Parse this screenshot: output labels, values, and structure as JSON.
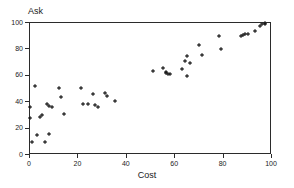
{
  "chart_data": {
    "type": "scatter",
    "title": "",
    "xlabel": "Cost",
    "ylabel": "Ask",
    "xlim": [
      0,
      100
    ],
    "ylim": [
      0,
      100
    ],
    "xticks": [
      0,
      20,
      40,
      60,
      80,
      100
    ],
    "yticks": [
      0,
      20,
      40,
      60,
      80,
      100
    ],
    "grid": false,
    "legend": null,
    "marker": "asterisk",
    "marker_color": "#111111",
    "series": [
      {
        "name": "observations",
        "points": [
          [
            0,
            36
          ],
          [
            0,
            28
          ],
          [
            1,
            10
          ],
          [
            2,
            52
          ],
          [
            3,
            15
          ],
          [
            4,
            29
          ],
          [
            5,
            30
          ],
          [
            6,
            10
          ],
          [
            7,
            39
          ],
          [
            8,
            37
          ],
          [
            8,
            16
          ],
          [
            9,
            36
          ],
          [
            12,
            51
          ],
          [
            13,
            44
          ],
          [
            14,
            31
          ],
          [
            21,
            51
          ],
          [
            22,
            39
          ],
          [
            24,
            39
          ],
          [
            26,
            46
          ],
          [
            27,
            38
          ],
          [
            28,
            36
          ],
          [
            31,
            47
          ],
          [
            32,
            45
          ],
          [
            35,
            41
          ],
          [
            51,
            64
          ],
          [
            55,
            66
          ],
          [
            56,
            62
          ],
          [
            56,
            63
          ],
          [
            57,
            61
          ],
          [
            58,
            61
          ],
          [
            63,
            65
          ],
          [
            64,
            71
          ],
          [
            65,
            60
          ],
          [
            65,
            75
          ],
          [
            66,
            70
          ],
          [
            70,
            83
          ],
          [
            71,
            76
          ],
          [
            78,
            90
          ],
          [
            79,
            80
          ],
          [
            87,
            90
          ],
          [
            88,
            91
          ],
          [
            89,
            92
          ],
          [
            90,
            92
          ],
          [
            93,
            94
          ],
          [
            95,
            98
          ],
          [
            96,
            99
          ],
          [
            97,
            100
          ],
          [
            97,
            99
          ]
        ]
      }
    ]
  },
  "axes": {
    "ylabel_text": "Ask",
    "xlabel_text": "Cost"
  }
}
